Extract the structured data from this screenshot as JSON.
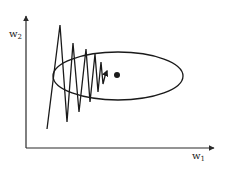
{
  "diagram": {
    "title": "",
    "axes": {
      "x_label": {
        "base": "w",
        "subscript": "1"
      },
      "y_label": {
        "base": "w",
        "subscript": "2"
      },
      "origin": [
        26,
        148
      ],
      "x_end": [
        215,
        148
      ],
      "y_end": [
        26,
        15
      ]
    },
    "contour": {
      "shape": "ellipse",
      "center": [
        118,
        76
      ],
      "rx": 65,
      "ry": 24
    },
    "trajectory": {
      "points": [
        [
          47,
          129
        ],
        [
          60,
          25
        ],
        [
          67,
          122
        ],
        [
          73,
          43
        ],
        [
          79,
          112
        ],
        [
          86,
          49
        ],
        [
          90,
          102
        ],
        [
          95,
          54
        ],
        [
          98,
          92
        ],
        [
          101,
          62
        ],
        [
          103,
          84
        ],
        [
          105,
          76
        ],
        [
          107,
          71
        ]
      ],
      "arrowhead": true
    },
    "minimum": {
      "marker": "filled-circle",
      "center": [
        117,
        75
      ],
      "r": 3
    },
    "colors": {
      "stroke": "#1a1a1a",
      "axis": "#2a2a2a",
      "background": "#ffffff"
    }
  }
}
